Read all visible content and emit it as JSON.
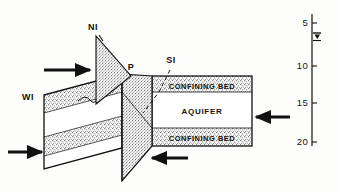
{
  "figure": {
    "colors": {
      "ink": "#111111",
      "stipple": "#8f8f8f",
      "page": "#fdfdfc",
      "aquifer_fill": "#ffffff"
    },
    "point_labels": [
      {
        "id": "NI",
        "label": "NI",
        "x": 93,
        "y": 30
      },
      {
        "id": "P",
        "label": "P",
        "x": 131,
        "y": 70
      },
      {
        "id": "SI",
        "label": "SI",
        "x": 171,
        "y": 63
      },
      {
        "id": "WI",
        "label": "WI",
        "x": 22,
        "y": 100
      }
    ],
    "unit_labels": [
      {
        "id": "upper-confining-bed",
        "label": "CONFINING BED",
        "x": 168,
        "y": 93
      },
      {
        "id": "aquifer",
        "label": "AQUIFER",
        "x": 180,
        "y": 116
      },
      {
        "id": "lower-confining-bed",
        "label": "CONFINING BED",
        "x": 168,
        "y": 138
      }
    ],
    "flow_arrows": [
      {
        "id": "arrow-ni-recharge",
        "direction": "right",
        "x": 64,
        "y": 70
      },
      {
        "id": "arrow-wi-recharge",
        "direction": "right",
        "x": 7,
        "y": 152
      },
      {
        "id": "arrow-aquifer-inflow",
        "direction": "left",
        "x": 265,
        "y": 117
      },
      {
        "id": "arrow-plane-inflow",
        "direction": "left",
        "x": 155,
        "y": 158
      }
    ],
    "scale": {
      "id": "depth-scale",
      "ticks": [
        {
          "label": "5",
          "value": 5,
          "y": 23
        },
        {
          "label": "10",
          "value": 10,
          "y": 66
        },
        {
          "label": "15",
          "value": 15,
          "y": 103
        },
        {
          "label": "20",
          "value": 20,
          "y": 142
        }
      ],
      "water_table_symbol": "water-table-triangle",
      "water_table_y": 36,
      "axis_x": 312,
      "axis_top": 14,
      "axis_bottom": 146
    }
  }
}
